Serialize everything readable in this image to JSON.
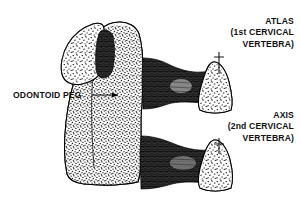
{
  "figure": {
    "kind": "anatomical-line-drawing",
    "background_color": "#ffffff",
    "ink_color": "#000000",
    "texture": "stippled trabecular bone with dense black cortical bands"
  },
  "labels": {
    "odontoid": {
      "text": "ODONTOID PEG",
      "leader": "horizontal-arrow-right"
    },
    "atlas": {
      "line1": "ATLAS",
      "line2": "(1st CERVICAL",
      "line3": "VERTEBRA)",
      "leader": "vertical-tick-down"
    },
    "axis": {
      "line1": "AXIS",
      "line2": "(2nd CERVICAL",
      "line3": "VERTEBRA)",
      "leader": "vertical-tick-down"
    }
  },
  "structures": [
    {
      "name": "odontoid-peg",
      "description": "dome-topped odontoid process, stippled"
    },
    {
      "name": "axis-body",
      "description": "large stippled vertebral body below the peg"
    },
    {
      "name": "atlas-anterior-arch",
      "description": "upper-left oval lateral mass with dark cortical band"
    },
    {
      "name": "atlas-lateral-mass-right",
      "description": "upper-right triangular stippled mass"
    },
    {
      "name": "axis-lateral-mass-right",
      "description": "lower-right triangular stippled mass"
    },
    {
      "name": "upper-dark-band",
      "description": "dark hourglass cortical band between odontoid and atlas mass"
    },
    {
      "name": "lower-dark-band",
      "description": "dark hourglass cortical band between axis body and axis mass"
    }
  ]
}
